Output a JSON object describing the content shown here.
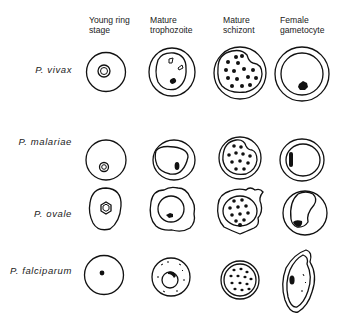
{
  "figure": {
    "columns": [
      {
        "line1": "Young ring",
        "line2": "stage"
      },
      {
        "line1": "Mature",
        "line2": "trophozoite"
      },
      {
        "line1": "Mature",
        "line2": "schizont"
      },
      {
        "line1": "Female",
        "line2": "gametocyte"
      }
    ],
    "rows": [
      {
        "label": "P. vivax"
      },
      {
        "label": "P. malariae"
      },
      {
        "label": "P. ovale"
      },
      {
        "label": "P. falciparum"
      }
    ]
  }
}
